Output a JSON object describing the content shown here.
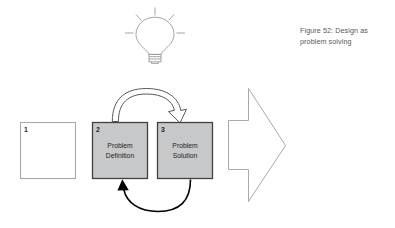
{
  "figure": {
    "caption": "Figure 52: Design as problem solving",
    "background_color": "#ffffff"
  },
  "lightbulb": {
    "icon_name": "lightbulb-icon",
    "stroke_color": "#9a9a9c",
    "ray_count": 5
  },
  "boxes": [
    {
      "number": "1",
      "label": "",
      "fill": "#ffffff",
      "stroke": "#a7a9ac"
    },
    {
      "number": "2",
      "label": "Problem\nDefinition",
      "line1": "Problem",
      "line2": "Definition",
      "fill": "#c7c8ca",
      "stroke": "#414042"
    },
    {
      "number": "3",
      "label": "Problem\nSolution",
      "line1": "Problem",
      "line2": "Solution",
      "fill": "#c7c8ca",
      "stroke": "#414042"
    }
  ],
  "arrows": {
    "top_loop": {
      "name": "hollow-curved-arrow-right",
      "direction": "definition-to-solution",
      "style": "outlined",
      "stroke": "#58595b",
      "fill": "#ffffff"
    },
    "bottom_loop": {
      "name": "solid-curved-arrow-left",
      "direction": "solution-to-definition",
      "style": "solid",
      "stroke": "#000000"
    },
    "outcome": {
      "name": "large-hollow-arrow-right",
      "style": "outlined",
      "stroke": "#a7a9ac",
      "fill": "#ffffff"
    }
  }
}
